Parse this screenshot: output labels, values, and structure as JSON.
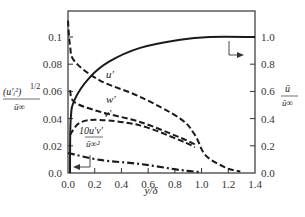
{
  "chart_data": {
    "type": "line",
    "title": "",
    "xlabel": "y/δ",
    "ylabel_left": "(u_i'^2)^(1/2) / ū_∞",
    "ylabel_right": "ū / ū_∞",
    "xlim": [
      0.0,
      1.4
    ],
    "ylim_left": [
      0.0,
      0.1
    ],
    "ylim_right": [
      0.0,
      1.0
    ],
    "x_ticks": [
      "0.0",
      "0.2",
      "0.4",
      "0.6",
      "0.8",
      "1.0",
      "1.2",
      "1.4"
    ],
    "y_left_ticks": [
      "0.0",
      "0.02",
      "0.04",
      "0.06",
      "0.08",
      "0.1"
    ],
    "y_right_ticks": [
      "0.0",
      "0.2",
      "0.4",
      "0.6",
      "0.8",
      "1.0"
    ],
    "grid": false,
    "series": [
      {
        "name": "ū/ū∞",
        "axis": "right",
        "style": "solid",
        "x": [
          0.015,
          0.02,
          0.05,
          0.16,
          0.31,
          0.54,
          0.84,
          1.06,
          1.4
        ],
        "y": [
          0.0,
          0.39,
          0.54,
          0.7,
          0.82,
          0.92,
          0.98,
          1.0,
          1.0
        ]
      },
      {
        "name": "u'",
        "axis": "left",
        "style": "dashed",
        "x": [
          0.0,
          0.015,
          0.05,
          0.24,
          0.54,
          0.84,
          0.95,
          1.03,
          1.18,
          1.29
        ],
        "y": [
          0.112,
          0.094,
          0.082,
          0.068,
          0.056,
          0.04,
          0.028,
          0.013,
          0.004,
          0.001
        ]
      },
      {
        "name": "w'",
        "axis": "left",
        "style": "dashed",
        "x": [
          0.015,
          0.05,
          0.24,
          0.54,
          0.84,
          0.95
        ],
        "y": [
          0.061,
          0.052,
          0.045,
          0.0375,
          0.026,
          0.021
        ]
      },
      {
        "name": "v'",
        "axis": "left",
        "style": "dashed",
        "x": [
          0.015,
          0.09,
          0.24,
          0.54,
          0.84,
          0.95
        ],
        "y": [
          0.028,
          0.037,
          0.039,
          0.035,
          0.024,
          0.019
        ]
      },
      {
        "name": "10u'v'/ū∞²",
        "axis": "left",
        "style": "dash-dot",
        "x": [
          0.0,
          0.24,
          0.54,
          0.84,
          0.99
        ],
        "y": [
          0.0147,
          0.0096,
          0.0066,
          0.0022,
          0.0007
        ]
      }
    ],
    "annotations": [
      {
        "text": "u'",
        "x": 0.28,
        "y": 0.073
      },
      {
        "text": "w'",
        "x": 0.28,
        "y": 0.052
      },
      {
        "text": "v'",
        "x": 0.26,
        "y": 0.042
      },
      {
        "text": "10u'v' / ū∞²",
        "x": 0.22,
        "y": 0.028
      },
      {
        "text": "arrow → right axis",
        "x": 1.1,
        "y": 0.095
      },
      {
        "text": "arrow ← left axis",
        "x": 0.1,
        "y": 0.002
      }
    ]
  },
  "labels": {
    "xlabel": "y/δ",
    "left_num": "(u′ᵢ²)",
    "left_exp": "1/2",
    "left_den": "ū∞",
    "right_num": "ū",
    "right_den": "ū∞",
    "ann_u": "u′",
    "ann_w": "w′",
    "ann_v": "v′",
    "ann_uv_num": "10u′v′",
    "ann_uv_den": "ū∞²"
  }
}
